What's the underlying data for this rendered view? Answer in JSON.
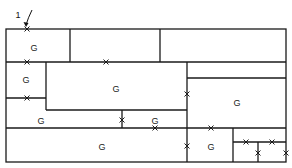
{
  "diagram": {
    "start_marker": {
      "label": "1",
      "x": 18,
      "y": 12,
      "arrow_to": [
        26,
        28
      ]
    },
    "colors": {
      "line": "#1a1a1a",
      "background": "#ffffff"
    },
    "outer_box": {
      "x1": 6,
      "y1": 29,
      "x2": 286,
      "y2": 162
    },
    "walls": [
      {
        "x1": 70,
        "y1": 29,
        "x2": 70,
        "y2": 62
      },
      {
        "x1": 160,
        "y1": 29,
        "x2": 160,
        "y2": 62
      },
      {
        "x1": 6,
        "y1": 62,
        "x2": 286,
        "y2": 62
      },
      {
        "x1": 46,
        "y1": 62,
        "x2": 46,
        "y2": 110
      },
      {
        "x1": 6,
        "y1": 98,
        "x2": 46,
        "y2": 98
      },
      {
        "x1": 46,
        "y1": 110,
        "x2": 187,
        "y2": 110
      },
      {
        "x1": 187,
        "y1": 62,
        "x2": 187,
        "y2": 162
      },
      {
        "x1": 187,
        "y1": 78,
        "x2": 286,
        "y2": 78
      },
      {
        "x1": 122,
        "y1": 110,
        "x2": 122,
        "y2": 128
      },
      {
        "x1": 6,
        "y1": 128,
        "x2": 286,
        "y2": 128
      },
      {
        "x1": 233,
        "y1": 128,
        "x2": 233,
        "y2": 162
      },
      {
        "x1": 233,
        "y1": 142,
        "x2": 286,
        "y2": 142
      },
      {
        "x1": 258,
        "y1": 142,
        "x2": 258,
        "y2": 162
      }
    ],
    "doors": [
      {
        "x": 27,
        "y": 29
      },
      {
        "x": 27,
        "y": 62
      },
      {
        "x": 106,
        "y": 62
      },
      {
        "x": 27,
        "y": 98
      },
      {
        "x": 187,
        "y": 94
      },
      {
        "x": 122,
        "y": 120
      },
      {
        "x": 155,
        "y": 128
      },
      {
        "x": 211,
        "y": 128
      },
      {
        "x": 187,
        "y": 146
      },
      {
        "x": 246,
        "y": 142
      },
      {
        "x": 272,
        "y": 142
      },
      {
        "x": 258,
        "y": 153
      },
      {
        "x": 286,
        "y": 153
      }
    ],
    "rooms": [
      {
        "label": "G",
        "x": 34,
        "y": 49
      },
      {
        "label": "G",
        "x": 26,
        "y": 81
      },
      {
        "label": "G",
        "x": 116,
        "y": 90
      },
      {
        "label": "G",
        "x": 237,
        "y": 104
      },
      {
        "label": "G",
        "x": 41,
        "y": 122
      },
      {
        "label": "G",
        "x": 155,
        "y": 122
      },
      {
        "label": "G",
        "x": 102,
        "y": 148
      },
      {
        "label": "G",
        "x": 211,
        "y": 148
      }
    ]
  }
}
